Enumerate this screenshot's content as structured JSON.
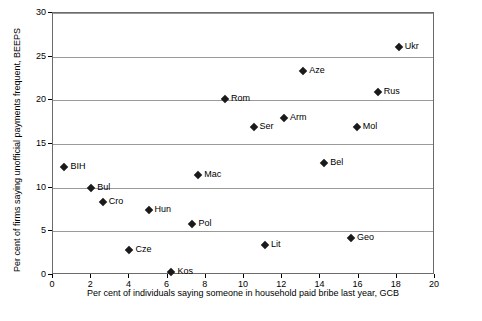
{
  "chart_data": {
    "type": "scatter",
    "title": "",
    "xlabel": "Per cent of individuals saying someone in household paid bribe last year, GCB",
    "ylabel": "Per cent of firms saying unofficial payments frequent, BEEPS",
    "xlim": [
      0,
      20
    ],
    "ylim": [
      0,
      30
    ],
    "xticks": [
      0,
      2,
      4,
      6,
      8,
      10,
      12,
      14,
      16,
      18,
      20
    ],
    "yticks": [
      0,
      5,
      10,
      15,
      20,
      25,
      30
    ],
    "grid": "horizontal",
    "legend": "none",
    "points": [
      {
        "label": "BIH",
        "x": 0.6,
        "y": 12.4,
        "label_pos": "right"
      },
      {
        "label": "Bul",
        "x": 2.0,
        "y": 10.0,
        "label_pos": "right"
      },
      {
        "label": "Cro",
        "x": 2.6,
        "y": 8.4,
        "label_pos": "right"
      },
      {
        "label": "Cze",
        "x": 4.0,
        "y": 2.9,
        "label_pos": "right"
      },
      {
        "label": "Hun",
        "x": 5.0,
        "y": 7.4,
        "label_pos": "right"
      },
      {
        "label": "Kos",
        "x": 6.2,
        "y": 0.4,
        "label_pos": "right"
      },
      {
        "label": "Pol",
        "x": 7.3,
        "y": 5.8,
        "label_pos": "right"
      },
      {
        "label": "Mac",
        "x": 7.6,
        "y": 11.5,
        "label_pos": "right"
      },
      {
        "label": "Rom",
        "x": 9.0,
        "y": 20.1,
        "label_pos": "right"
      },
      {
        "label": "Ser",
        "x": 10.5,
        "y": 17.0,
        "label_pos": "right"
      },
      {
        "label": "Lit",
        "x": 11.1,
        "y": 3.4,
        "label_pos": "right"
      },
      {
        "label": "Arm",
        "x": 12.1,
        "y": 18.0,
        "label_pos": "right"
      },
      {
        "label": "Aze",
        "x": 13.1,
        "y": 23.4,
        "label_pos": "right"
      },
      {
        "label": "Bel",
        "x": 14.2,
        "y": 12.8,
        "label_pos": "right"
      },
      {
        "label": "Geo",
        "x": 15.6,
        "y": 4.2,
        "label_pos": "right"
      },
      {
        "label": "Mol",
        "x": 15.9,
        "y": 17.0,
        "label_pos": "right"
      },
      {
        "label": "Rus",
        "x": 17.0,
        "y": 21.0,
        "label_pos": "right"
      },
      {
        "label": "Ukr",
        "x": 18.1,
        "y": 26.1,
        "label_pos": "right"
      }
    ]
  }
}
